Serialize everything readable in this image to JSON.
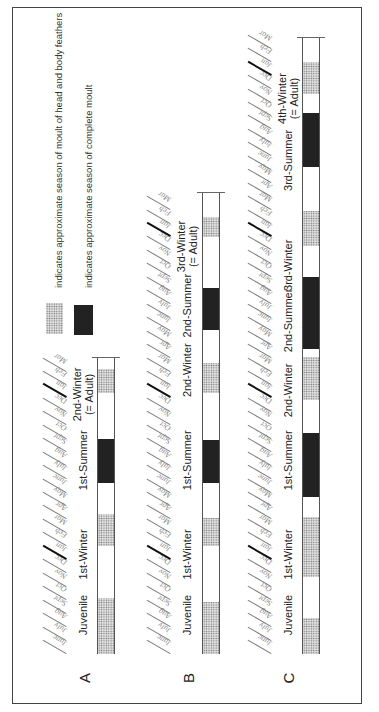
{
  "legend": {
    "items": [
      {
        "swatch": "dotted",
        "label": "indicates approximate season of moult of head and body feathers"
      },
      {
        "swatch": "dark",
        "label": "indicates approximate season of complete moult"
      }
    ]
  },
  "months": [
    "June",
    "July",
    "Aug",
    "Sept",
    "Oct",
    "Nov",
    "Dec",
    "Jan",
    "Feb",
    "Mar",
    "Apr",
    "May"
  ],
  "rows": [
    {
      "letter": "A",
      "months_total": 22,
      "labels": [
        {
          "text": "Juvenile",
          "at": 2.9
        },
        {
          "text": "1st-Winter",
          "at": 7.4
        },
        {
          "text": "1st-Summer",
          "at": 14.4
        },
        {
          "text": "2nd-Winter",
          "sub": "(= Adult)",
          "at": 19.3
        }
      ]
    },
    {
      "letter": "B",
      "months_total": 34,
      "labels": [
        {
          "text": "Juvenile",
          "at": 2.9
        },
        {
          "text": "1st-Winter",
          "at": 7.4
        },
        {
          "text": "1st-Summer",
          "at": 14.4
        },
        {
          "text": "2nd-Winter",
          "at": 21.1
        },
        {
          "text": "2nd-Summer",
          "at": 25.9
        },
        {
          "text": "3rd-Winter",
          "sub": "(= Adult)",
          "at": 30.3
        }
      ]
    },
    {
      "letter": "C",
      "months_total": 46,
      "labels": [
        {
          "text": "Juvenile",
          "at": 2.9
        },
        {
          "text": "1st-Winter",
          "at": 7.4
        },
        {
          "text": "1st-Summer",
          "at": 14.4
        },
        {
          "text": "2nd-Winter",
          "at": 19.6
        },
        {
          "text": "2nd-Summer",
          "at": 24.8
        },
        {
          "text": "3rd-Winter",
          "at": 28.9
        },
        {
          "text": "3rd-Summer",
          "at": 36.7
        },
        {
          "text": "4th-Winter",
          "sub": "(= Adult)",
          "at": 41.3
        }
      ]
    }
  ],
  "chart_data": {
    "type": "table",
    "xlabel": "Month (starting June)",
    "legend": [
      "moult of head and body feathers (dotted)",
      "complete moult (dark)"
    ],
    "series": [
      {
        "name": "A",
        "segments": [
          {
            "type": "dotted",
            "start": 0,
            "end": 4.2
          },
          {
            "type": "white",
            "start": 4.2,
            "end": 8
          },
          {
            "type": "dotted",
            "start": 8,
            "end": 10.4
          },
          {
            "type": "white",
            "start": 10.4,
            "end": 12.7
          },
          {
            "type": "dark",
            "start": 12.7,
            "end": 16
          },
          {
            "type": "white",
            "start": 16,
            "end": 19.4
          },
          {
            "type": "dotted",
            "start": 19.4,
            "end": 21.2
          },
          {
            "type": "white",
            "start": 21.2,
            "end": 22
          }
        ]
      },
      {
        "name": "B",
        "segments": [
          {
            "type": "dotted",
            "start": 0,
            "end": 3.9
          },
          {
            "type": "white",
            "start": 3.9,
            "end": 8
          },
          {
            "type": "dotted",
            "start": 8,
            "end": 10.1
          },
          {
            "type": "white",
            "start": 10.1,
            "end": 12.7
          },
          {
            "type": "dark",
            "start": 12.7,
            "end": 15.9
          },
          {
            "type": "white",
            "start": 15.9,
            "end": 19.4
          },
          {
            "type": "dotted",
            "start": 19.4,
            "end": 21.6
          },
          {
            "type": "white",
            "start": 21.6,
            "end": 24.1
          },
          {
            "type": "dark",
            "start": 24.1,
            "end": 27.2
          },
          {
            "type": "white",
            "start": 27.2,
            "end": 31
          },
          {
            "type": "dotted",
            "start": 31,
            "end": 32.5
          },
          {
            "type": "white",
            "start": 32.5,
            "end": 34.3
          }
        ]
      },
      {
        "name": "C",
        "segments": [
          {
            "type": "dotted",
            "start": 0,
            "end": 2.7
          },
          {
            "type": "white",
            "start": 2.7,
            "end": 5.7
          },
          {
            "type": "dotted",
            "start": 5.7,
            "end": 10.2
          },
          {
            "type": "white",
            "start": 10.2,
            "end": 11.7
          },
          {
            "type": "dark",
            "start": 11.7,
            "end": 16.4
          },
          {
            "type": "white",
            "start": 16.4,
            "end": 18.9
          },
          {
            "type": "dotted",
            "start": 18.9,
            "end": 22.1
          },
          {
            "type": "white",
            "start": 22.1,
            "end": 22.7
          },
          {
            "type": "dark",
            "start": 22.7,
            "end": 28
          },
          {
            "type": "white",
            "start": 28,
            "end": 30.3
          },
          {
            "type": "dotted",
            "start": 30.3,
            "end": 32.9
          },
          {
            "type": "white",
            "start": 32.9,
            "end": 36.2
          },
          {
            "type": "dark",
            "start": 36.2,
            "end": 40.2
          },
          {
            "type": "white",
            "start": 40.2,
            "end": 41.6
          },
          {
            "type": "dotted",
            "start": 41.6,
            "end": 44
          },
          {
            "type": "white",
            "start": 44,
            "end": 45.8
          }
        ]
      }
    ],
    "colors": {
      "dotted": "#d8d8d8",
      "dark": "#3a3a3a",
      "white": "#ffffff"
    }
  }
}
